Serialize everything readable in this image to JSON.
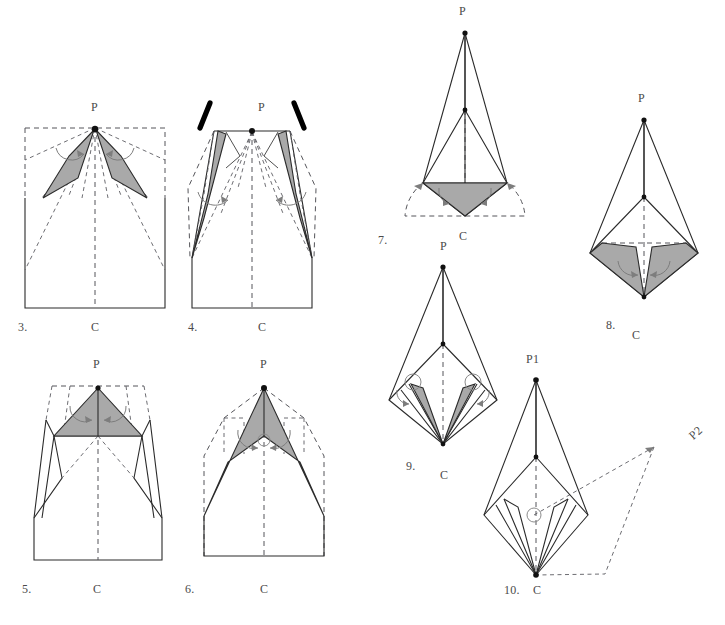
{
  "page": {
    "background_color": "#ffffff",
    "ink_color": "#2b2b2b",
    "shade_color": "#a9a9a9",
    "dash_color": "#55555a",
    "accent_black": "#000000",
    "width": 725,
    "height": 625
  },
  "figures": [
    {
      "number": "3.",
      "apex_label": "P",
      "base_label": "C",
      "caption_number": "3.",
      "notes": "square outline with dashed construction lines, two shaded flaps near apex"
    },
    {
      "number": "4.",
      "apex_label": "P",
      "base_label": "C",
      "caption_number": "4.",
      "notes": "two thick black strokes above apex, two long shaded flaps"
    },
    {
      "number": "5.",
      "apex_label": "P",
      "base_label": "C",
      "caption_number": "5.",
      "notes": "wide shaded triangular band folded down from apex"
    },
    {
      "number": "6.",
      "apex_label": "P",
      "base_label": "C",
      "caption_number": "6.",
      "notes": "large shaded chevron from apex to base corners"
    },
    {
      "number": "7.",
      "apex_label": "P",
      "base_label": "C",
      "caption_number": "7.",
      "notes": "kite form with shaded lower diamond and dashed semicircular outline"
    },
    {
      "number": "8.",
      "apex_label": "P",
      "base_label": "C",
      "caption_number": "8.",
      "notes": "narrow kite with two shaded lower flaps"
    },
    {
      "number": "9.",
      "apex_label": "P",
      "base_label": "C",
      "caption_number": "9.",
      "notes": "narrow kite with two thin shaded spikes and small rotation circles"
    },
    {
      "number": "10.",
      "apex_label": "P1",
      "secondary_label": "P2",
      "base_label": "C",
      "caption_number": "10.",
      "notes": "finished kite with unshaded spikes and dashed projection to P2"
    }
  ],
  "labels": {
    "fig3_P": "P",
    "fig3_C": "C",
    "fig3_num": "3.",
    "fig4_P": "P",
    "fig4_C": "C",
    "fig4_num": "4.",
    "fig5_P": "P",
    "fig5_C": "C",
    "fig5_num": "5.",
    "fig6_P": "P",
    "fig6_C": "C",
    "fig6_num": "6.",
    "fig7_P": "P",
    "fig7_C": "C",
    "fig7_num": "7.",
    "fig8_P": "P",
    "fig8_C": "C",
    "fig8_num": "8.",
    "fig9_P": "P",
    "fig9_C": "C",
    "fig9_num": "9.",
    "fig10_P1": "P1",
    "fig10_P2": "P2",
    "fig10_C": "C",
    "fig10_num": "10."
  }
}
